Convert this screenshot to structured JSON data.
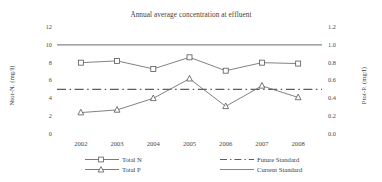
{
  "chart_data": {
    "type": "line",
    "title": "Annual average concentration at effluent",
    "xlabel": "",
    "ylabel": "Ntot-N. (mg/l)",
    "ylabel_right": "Ptot-P. (mg/l)",
    "categories": [
      "2002",
      "2003",
      "2004",
      "2005",
      "2006",
      "2007",
      "2008"
    ],
    "ylim": [
      0,
      12
    ],
    "yticks": [
      "0",
      "2",
      "4",
      "6",
      "8",
      "10",
      "12"
    ],
    "ylim_right": [
      0,
      1.2
    ],
    "yticks_right": [
      "0.0",
      "0.2",
      "0.4",
      "0.6",
      "0.8",
      "1.0",
      "1.2"
    ],
    "grid": false,
    "legend_position": "bottom",
    "series": [
      {
        "name": "Total N",
        "axis": "left",
        "marker": "square",
        "linestyle": "solid",
        "color": "#6b6b6b",
        "values": [
          8.0,
          8.2,
          7.3,
          8.6,
          7.1,
          8.0,
          7.9
        ]
      },
      {
        "name": "Total P",
        "axis": "right",
        "marker": "triangle",
        "linestyle": "solid",
        "color": "#6b6b6b",
        "values": [
          0.24,
          0.27,
          0.4,
          0.62,
          0.31,
          0.54,
          0.41
        ]
      },
      {
        "name": "Future Standard",
        "axis": "left",
        "marker": "none",
        "linestyle": "dashdot",
        "color": "#5e5e5e",
        "constant": 5.0
      },
      {
        "name": "Current Standard",
        "axis": "left",
        "marker": "none",
        "linestyle": "solid",
        "color": "#878787",
        "constant": 10.0
      }
    ]
  },
  "legend": {
    "total_n": "Total N",
    "total_p": "Total P",
    "future_standard": "Future Standard",
    "current_standard": "Current Standard"
  }
}
